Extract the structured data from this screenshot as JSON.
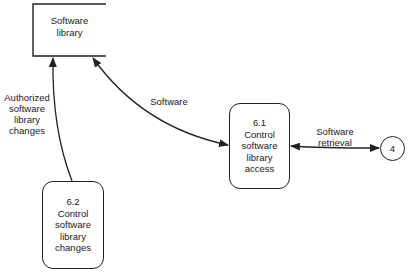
{
  "diagram": {
    "type": "data-flow-diagram",
    "data_store": {
      "lines": [
        "Software",
        "library"
      ]
    },
    "processes": [
      {
        "id": "6.1",
        "lines": [
          "6.1",
          "Control",
          "software",
          "library",
          "access"
        ]
      },
      {
        "id": "6.2",
        "lines": [
          "6.2",
          "Control",
          "software",
          "library",
          "changes"
        ]
      }
    ],
    "external_entity": {
      "label": "4"
    },
    "flows": [
      {
        "from": "6.2",
        "to": "Software library",
        "direction": "one-way",
        "lines": [
          "Authorized",
          "software",
          "library",
          "changes"
        ]
      },
      {
        "from": "Software library",
        "to": "6.1",
        "direction": "two-way",
        "lines": [
          "Software"
        ]
      },
      {
        "from": "6.1",
        "to": "4",
        "direction": "two-way",
        "lines": [
          "Software",
          "retrieval"
        ]
      }
    ]
  }
}
